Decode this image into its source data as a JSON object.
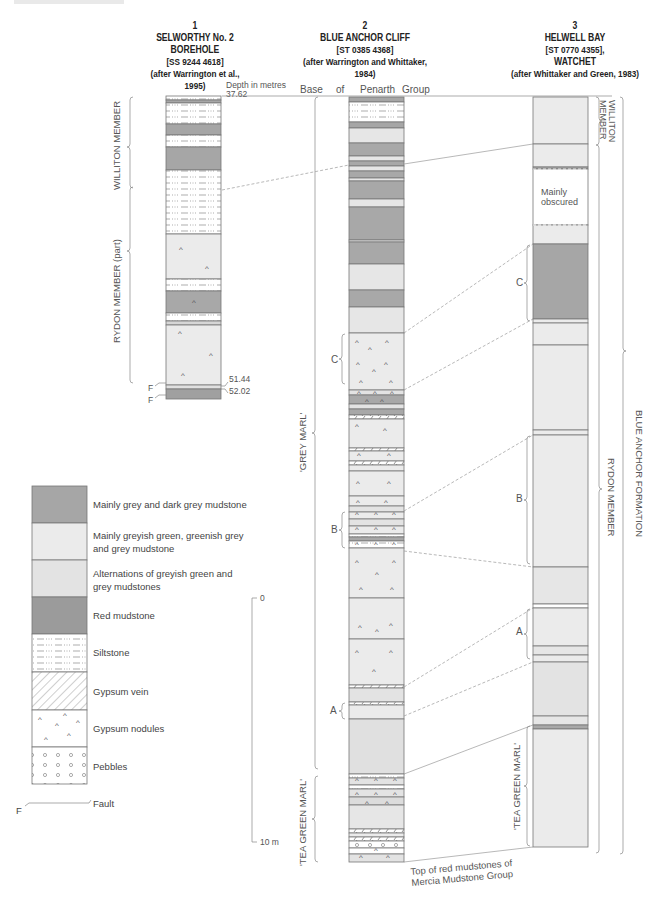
{
  "figure": {
    "columns": [
      {
        "number": "1",
        "name_line1": "SELWORTHY No. 2",
        "name_line2": "BOREHOLE",
        "grid_ref": "[SS 9244 4618]",
        "source": "(after Warrington et al., 1995)"
      },
      {
        "number": "2",
        "name_line1": "BLUE ANCHOR CLIFF",
        "name_line2": "",
        "grid_ref": "[ST 0385 4368]",
        "source": "(after Warrington and Whittaker, 1984)"
      },
      {
        "number": "3",
        "name_line1": "HELWELL BAY",
        "name_line2": "[ST 0770 4355],",
        "grid_ref": "WATCHET",
        "source": "(after Whittaker and Green, 1983)"
      }
    ],
    "depth_label": "Depth in metres",
    "depth_top": "37.62",
    "depth_fault1": "51.44",
    "depth_fault2": "52.02",
    "fault_marker": "F",
    "base_label": [
      "Base",
      "of",
      "Penarth",
      "Group"
    ],
    "members": {
      "col1_williton": "WILLITON MEMBER",
      "col1_rydon": "RYDON MEMBER (part)",
      "col2_grey_marl": "'GREY MARL'",
      "col2_tea_green": "'TEA GREEN MARL'",
      "col3_williton_l1": "WILLITON",
      "col3_williton_l2": "MEMBER",
      "col3_rydon": "RYDON MEMBER",
      "col3_tea_green": "'TEA GREEN MARL'",
      "formation": "BLUE ANCHOR FORMATION"
    },
    "markers": {
      "c": "C",
      "b": "B",
      "a": "A"
    },
    "obscured_l1": "Mainly",
    "obscured_l2": "obscured",
    "bottom_note_l1": "Top of red mudstones of",
    "bottom_note_l2": "Mercia Mudstone Group",
    "scale": {
      "top": "0",
      "bottom": "10 m"
    }
  },
  "legend": {
    "items": [
      {
        "label_l1": "Mainly grey and dark grey mudstone",
        "label_l2": "",
        "pattern": "dark",
        "color": "#a6a6a6"
      },
      {
        "label_l1": "Mainly greyish green, greenish grey",
        "label_l2": "and grey mudstone",
        "pattern": "light",
        "color": "#ececec"
      },
      {
        "label_l1": "Alternations of greyish green and",
        "label_l2": "grey mudstones",
        "pattern": "light2",
        "color": "#e3e3e3"
      },
      {
        "label_l1": "Red mudstone",
        "label_l2": "",
        "pattern": "red",
        "color": "#9b9b9b"
      },
      {
        "label_l1": "Siltstone",
        "label_l2": "",
        "pattern": "silt",
        "color": "#ffffff"
      },
      {
        "label_l1": "Gypsum vein",
        "label_l2": "",
        "pattern": "vein",
        "color": "#ffffff"
      },
      {
        "label_l1": "Gypsum nodules",
        "label_l2": "",
        "pattern": "nodules",
        "color": "#ffffff"
      },
      {
        "label_l1": "Pebbles",
        "label_l2": "",
        "pattern": "pebbles",
        "color": "#ffffff"
      }
    ],
    "fault_label": "Fault",
    "fault_marker": "F"
  }
}
